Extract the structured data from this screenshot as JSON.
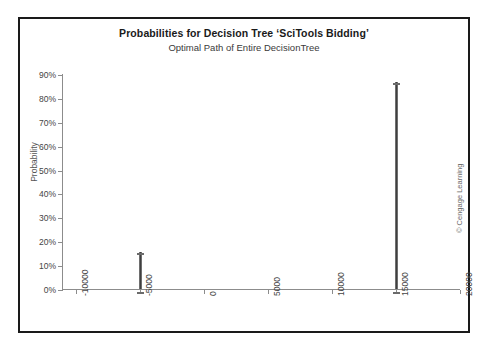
{
  "chart_data": {
    "type": "bar",
    "title": "Probabilities for Decision Tree ‘SciTools Bidding’",
    "subtitle": "Optimal Path of Entire DecisionTree",
    "xlabel": "",
    "ylabel": "Probability",
    "xlim": [
      -10000,
      20000
    ],
    "ylim": [
      0,
      90
    ],
    "grid": false,
    "legend": null,
    "y_tick_labels": [
      "90%",
      "80%",
      "70%",
      "60%",
      "50%",
      "40%",
      "30%",
      "20%",
      "10%",
      "0%"
    ],
    "y_tick_values": [
      90,
      80,
      70,
      60,
      50,
      40,
      30,
      20,
      10,
      0
    ],
    "x_tick_labels": [
      "-10000",
      "-5000",
      "0",
      "5000",
      "10000",
      "15000",
      "20000"
    ],
    "x_tick_values": [
      -10000,
      -5000,
      0,
      5000,
      10000,
      15000,
      20000
    ],
    "x": [
      -5000,
      15000
    ],
    "values": [
      15.5,
      86.5
    ],
    "bars": [
      {
        "x": -5000,
        "value": 15.5,
        "label": ""
      },
      {
        "x": 15000,
        "value": 86.5,
        "label": ""
      }
    ]
  },
  "credit": {
    "text": "© Cengage Learning"
  },
  "colors": {
    "bar_fill": "#3f3f3f",
    "bar_edge": "#6e6e6e",
    "axis": "#8c8c8c",
    "frame": "#1a1a1a",
    "title_text": "#1a1a1a",
    "tick_text": "#444444"
  }
}
